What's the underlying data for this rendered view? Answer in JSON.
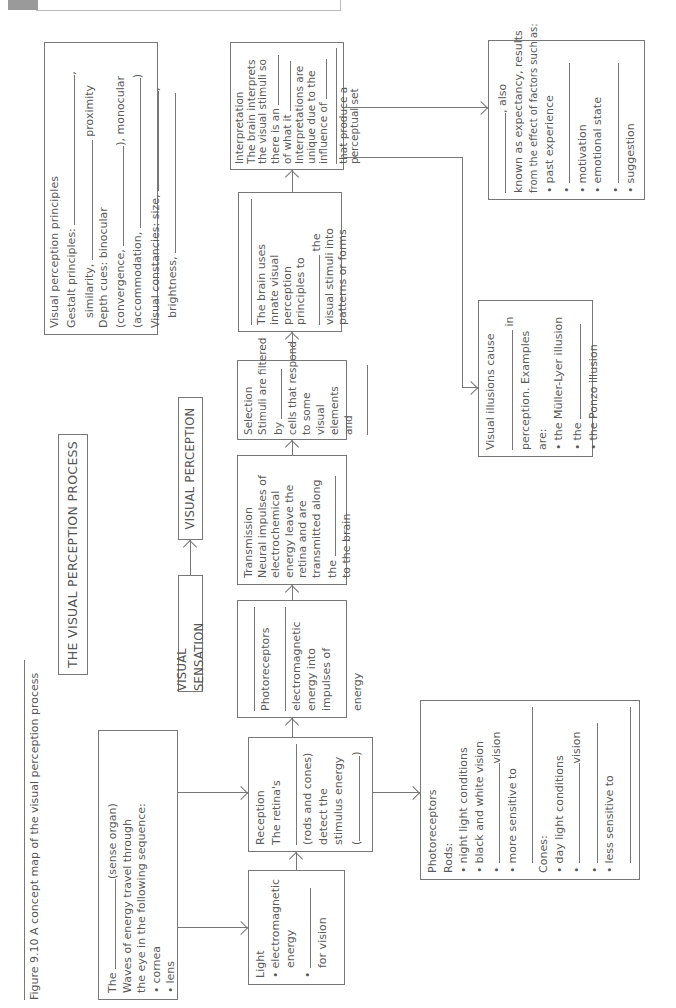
{
  "page": {
    "orientation": "rotated-90-ccw",
    "header_text": "CHAPTER 9 PROCESSES OF VISUAL PERCEPTION — WORKBOOK SKILLS PAGE"
  },
  "caption": "Figure 9.10 A concept map of the visual perception process",
  "title": "THE VISUAL PERCEPTION PROCESS",
  "stages": {
    "sensation": "VISUAL SENSATION",
    "perception": "VISUAL PERCEPTION"
  },
  "eye_box": {
    "line1_pre": "The",
    "line1_post": "(sense organ)",
    "line2": "Waves of energy travel through",
    "line3": "the eye in the following sequence:",
    "items": [
      "cornea",
      "lens",
      ""
    ]
  },
  "light_box": {
    "heading": "Light",
    "item1": "electromagnetic",
    "item1b": "energy",
    "item2_post": "for vision"
  },
  "reception_box": {
    "heading": "Reception",
    "line1": "The retina's",
    "line2": "(rods and cones)",
    "line3": "detect the",
    "line4": "stimulus energy",
    "line5_pre": "(",
    "line5_post": ")"
  },
  "photoreceptors_mid_box": {
    "line1": "Photoreceptors",
    "line2": "electromagnetic",
    "line3": "energy into",
    "line4": "impulses of",
    "line5": "energy"
  },
  "transmission_box": {
    "heading": "Transmission",
    "line1": "Neural impulses of",
    "line2": "electrochemical",
    "line3": "energy leave the",
    "line4": "retina and are",
    "line5": "transmitted along",
    "line6": "the",
    "line7": "to the brain"
  },
  "selection_box": {
    "heading": "Selection",
    "line1": "Stimuli are filtered",
    "line2": "by",
    "line3": "cells that respond",
    "line4": "to some visual",
    "line5": "elements and",
    "line6": "others"
  },
  "organisation_box": {
    "line1": "The brain uses",
    "line2": "innate visual",
    "line3": "perception",
    "line4": "principles to",
    "line5": "the",
    "line6": "visual stimuli into",
    "line7": "patterns or forms"
  },
  "interpretation_box": {
    "heading": "Interpretation",
    "line1": "The brain interprets",
    "line2": "the visual stimuli so",
    "line3": "there is an",
    "line4": "of what it",
    "line5": "Interpretations are",
    "line6": "unique due to the",
    "line7": "influence of",
    "line8": "that produce a",
    "line9": "perceptual set"
  },
  "principles_box": {
    "heading": "Visual perception principles",
    "line1": "Gestalt principles:",
    "line2_pre": "similarity,",
    "line2_post": "proximity",
    "line3": "Depth cues: binocular",
    "line4_pre": "(convergence,",
    "line4_post": "), monocular",
    "line5_pre": "(accommodation,",
    "line5_post": ")",
    "line6": "Visual constancies: size,",
    "line7": "brightness,"
  },
  "rods_cones_box": {
    "heading": "Photoreceptors",
    "rods_label": "Rods:",
    "rods_items": [
      "night light conditions",
      "black and white vision"
    ],
    "rods_blank_post": "vision",
    "rods_sensitive": "more sensitive to",
    "cones_label": "Cones:",
    "cones_items": [
      "day light conditions"
    ],
    "cones_blank_post": "vision",
    "cones_sensitive": "less sensitive to"
  },
  "illusions_box": {
    "line1": "Visual illusions cause",
    "line2_post": "in",
    "line3": "perception. Examples are:",
    "items": [
      "the Müller-Lyer illusion",
      "the",
      "the Ponzo illusion"
    ]
  },
  "perceptual_set_box": {
    "line1_post": ", also",
    "line2": "known as expectancy, results",
    "line3": "from the effect of factors such as:",
    "items": [
      "past experience",
      "",
      "motivation",
      "emotional state",
      "",
      "suggestion"
    ]
  }
}
